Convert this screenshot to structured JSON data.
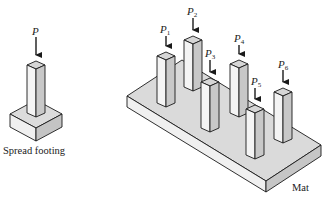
{
  "spread_footing": {
    "load_label": "P",
    "caption": "Spread footing"
  },
  "mat": {
    "caption": "Mat",
    "loads": [
      {
        "label": "P",
        "sub": "1"
      },
      {
        "label": "P",
        "sub": "2"
      },
      {
        "label": "P",
        "sub": "3"
      },
      {
        "label": "P",
        "sub": "4"
      },
      {
        "label": "P",
        "sub": "5"
      },
      {
        "label": "P",
        "sub": "6"
      }
    ]
  },
  "colors": {
    "outline": "#1a1a1a",
    "face_light": "#f2f2f2",
    "face_mid": "#d9d9d9",
    "face_dark": "#bdbdbd",
    "mat_top": "#dcdcdc"
  }
}
